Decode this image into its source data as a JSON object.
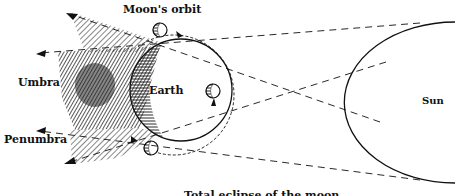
{
  "labels": {
    "moons_orbit": "Moon's orbit",
    "umbra": "Umbra",
    "earth": "Earth",
    "penumbra": "Penumbra",
    "sun": "Sun",
    "caption": "Total eclipse of the moon"
  },
  "colors": {
    "ink": "#111111",
    "background": "#ffffff"
  }
}
